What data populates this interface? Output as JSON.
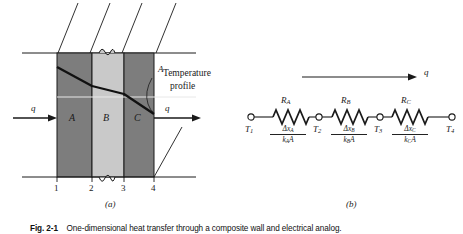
{
  "figure": {
    "number": "Fig. 2-1",
    "caption": "One-dimensional heat transfer through a composite wall and electrical analog.",
    "panel_a_tag": "(a)",
    "panel_b_tag": "(b)"
  },
  "wall": {
    "layers": [
      {
        "id": "A",
        "label": "A",
        "fill": "#7d7d7d"
      },
      {
        "id": "B",
        "label": "B",
        "fill": "#c9c9c9"
      },
      {
        "id": "C",
        "label": "C",
        "fill": "#7d7d7d"
      }
    ],
    "interface_numbers": [
      "1",
      "2",
      "3",
      "4"
    ],
    "area_label": "A",
    "heat_flux_in": "q",
    "heat_flux_out": "q",
    "profile_label_line1": "Temperature",
    "profile_label_line2": "profile"
  },
  "circuit": {
    "flux_label": "q",
    "nodes": [
      {
        "label": "T",
        "sub": "1"
      },
      {
        "label": "T",
        "sub": "2"
      },
      {
        "label": "T",
        "sub": "3"
      },
      {
        "label": "T",
        "sub": "4"
      }
    ],
    "resistors": [
      {
        "name": "R",
        "sub": "A",
        "num_delta": "Δx",
        "num_sub": "A",
        "den_k": "k",
        "den_sub": "A",
        "den_area": "A"
      },
      {
        "name": "R",
        "sub": "B",
        "num_delta": "Δx",
        "num_sub": "B",
        "den_k": "k",
        "den_sub": "B",
        "den_area": "A"
      },
      {
        "name": "R",
        "sub": "C",
        "num_delta": "Δx",
        "num_sub": "C",
        "den_k": "k",
        "den_sub": "C",
        "den_area": "A"
      }
    ]
  },
  "colors": {
    "dark_layer": "#7d7d7d",
    "light_layer": "#c9c9c9",
    "line": "#1a1a1a"
  }
}
